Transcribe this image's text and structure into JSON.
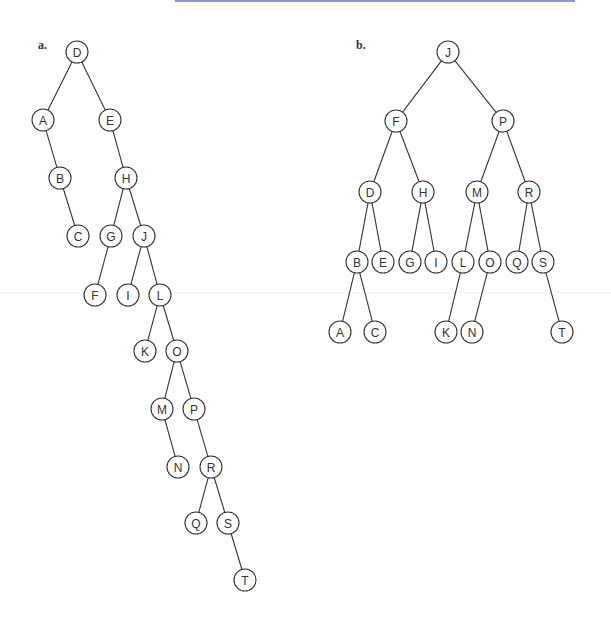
{
  "figure": {
    "panels": [
      {
        "id": "a",
        "label": "a.",
        "label_pos": [
          38,
          49
        ],
        "node_radius": 11,
        "nodes": [
          {
            "id": "D",
            "x": 77,
            "y": 52
          },
          {
            "id": "A",
            "x": 43,
            "y": 120
          },
          {
            "id": "E",
            "x": 110,
            "y": 120
          },
          {
            "id": "B",
            "x": 60,
            "y": 178
          },
          {
            "id": "H",
            "x": 126,
            "y": 178
          },
          {
            "id": "C",
            "x": 78,
            "y": 236
          },
          {
            "id": "G",
            "x": 111,
            "y": 236
          },
          {
            "id": "J",
            "x": 144,
            "y": 236
          },
          {
            "id": "F",
            "x": 95,
            "y": 295
          },
          {
            "id": "I",
            "x": 128,
            "y": 295
          },
          {
            "id": "L",
            "x": 160,
            "y": 295
          },
          {
            "id": "K",
            "x": 145,
            "y": 351
          },
          {
            "id": "O",
            "x": 177,
            "y": 351
          },
          {
            "id": "M",
            "x": 162,
            "y": 409
          },
          {
            "id": "P",
            "x": 194,
            "y": 409
          },
          {
            "id": "N",
            "x": 178,
            "y": 467
          },
          {
            "id": "R",
            "x": 211,
            "y": 467
          },
          {
            "id": "Q",
            "x": 196,
            "y": 523
          },
          {
            "id": "S",
            "x": 228,
            "y": 523
          },
          {
            "id": "T",
            "x": 245,
            "y": 580
          }
        ],
        "edges": [
          [
            "D",
            "A"
          ],
          [
            "D",
            "E"
          ],
          [
            "A",
            "B"
          ],
          [
            "B",
            "C"
          ],
          [
            "E",
            "H"
          ],
          [
            "H",
            "G"
          ],
          [
            "H",
            "J"
          ],
          [
            "G",
            "F"
          ],
          [
            "J",
            "I"
          ],
          [
            "J",
            "L"
          ],
          [
            "L",
            "K"
          ],
          [
            "L",
            "O"
          ],
          [
            "O",
            "M"
          ],
          [
            "O",
            "P"
          ],
          [
            "M",
            "N"
          ],
          [
            "P",
            "R"
          ],
          [
            "R",
            "Q"
          ],
          [
            "R",
            "S"
          ],
          [
            "S",
            "T"
          ]
        ]
      },
      {
        "id": "b",
        "label": "b.",
        "label_pos": [
          356,
          49
        ],
        "node_radius": 11,
        "nodes": [
          {
            "id": "J",
            "x": 448,
            "y": 52
          },
          {
            "id": "F",
            "x": 396,
            "y": 121
          },
          {
            "id": "P",
            "x": 503,
            "y": 121
          },
          {
            "id": "D",
            "x": 370,
            "y": 192
          },
          {
            "id": "H",
            "x": 423,
            "y": 192
          },
          {
            "id": "M",
            "x": 477,
            "y": 192
          },
          {
            "id": "R",
            "x": 529,
            "y": 192
          },
          {
            "id": "B",
            "x": 357,
            "y": 262
          },
          {
            "id": "E",
            "x": 383,
            "y": 262
          },
          {
            "id": "G",
            "x": 410,
            "y": 262
          },
          {
            "id": "I",
            "x": 436,
            "y": 262
          },
          {
            "id": "L",
            "x": 463,
            "y": 262
          },
          {
            "id": "O",
            "x": 490,
            "y": 262
          },
          {
            "id": "Q",
            "x": 517,
            "y": 262
          },
          {
            "id": "S",
            "x": 543,
            "y": 262
          },
          {
            "id": "A",
            "x": 340,
            "y": 332
          },
          {
            "id": "C",
            "x": 375,
            "y": 332
          },
          {
            "id": "K",
            "x": 446,
            "y": 332
          },
          {
            "id": "N",
            "x": 472,
            "y": 332
          },
          {
            "id": "T",
            "x": 562,
            "y": 332
          }
        ],
        "edges": [
          [
            "J",
            "F"
          ],
          [
            "J",
            "P"
          ],
          [
            "F",
            "D"
          ],
          [
            "F",
            "H"
          ],
          [
            "P",
            "M"
          ],
          [
            "P",
            "R"
          ],
          [
            "D",
            "B"
          ],
          [
            "D",
            "E"
          ],
          [
            "H",
            "G"
          ],
          [
            "H",
            "I"
          ],
          [
            "M",
            "L"
          ],
          [
            "M",
            "O"
          ],
          [
            "R",
            "Q"
          ],
          [
            "R",
            "S"
          ],
          [
            "B",
            "A"
          ],
          [
            "B",
            "C"
          ],
          [
            "L",
            "K"
          ],
          [
            "O",
            "N"
          ],
          [
            "S",
            "T"
          ]
        ]
      }
    ]
  },
  "colors": {
    "top_rule": "#8f97d6",
    "stroke": "#333333",
    "background": "#ffffff"
  }
}
